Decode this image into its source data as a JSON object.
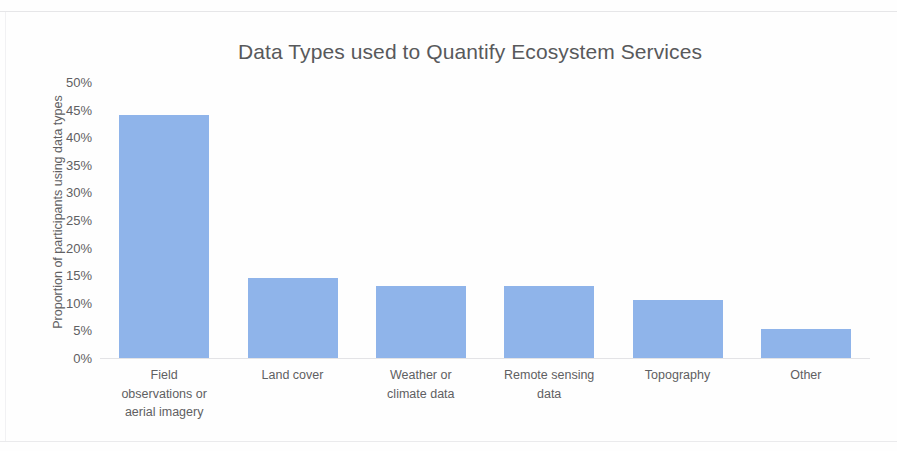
{
  "chart_data": {
    "type": "bar",
    "title": "Data Types used to Quantify Ecosystem Services",
    "xlabel": "",
    "ylabel": "Proportion of participants using data types",
    "categories": [
      "Field observations or aerial imagery",
      "Land cover",
      "Weather or climate data",
      "Remote sensing data",
      "Topography",
      "Other"
    ],
    "category_lines": [
      [
        "Field",
        "observations or",
        "aerial imagery"
      ],
      [
        "Land cover"
      ],
      [
        "Weather or",
        "climate data"
      ],
      [
        "Remote sensing",
        "data"
      ],
      [
        "Topography"
      ],
      [
        "Other"
      ]
    ],
    "values": [
      44,
      14.5,
      13,
      13,
      10.5,
      5.3
    ],
    "ylim": [
      0,
      50
    ],
    "ytick_labels": [
      "50%",
      "45%",
      "40%",
      "35%",
      "30%",
      "25%",
      "20%",
      "15%",
      "10%",
      "5%",
      "0%"
    ],
    "ytick_values": [
      50,
      45,
      40,
      35,
      30,
      25,
      20,
      15,
      10,
      5,
      0
    ],
    "grid": false,
    "legend": "none",
    "bar_color": "#8FB4EA",
    "text_color": "#5f6062",
    "title_color": "#58595b",
    "axis_line_color": "#e3e3e6",
    "background_color": "#fefefe"
  }
}
